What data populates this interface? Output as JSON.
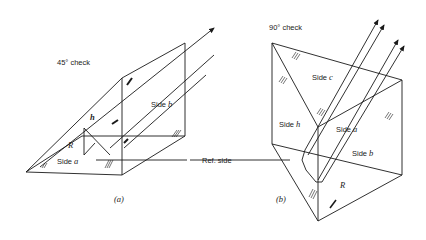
{
  "figure_a": {
    "title": "45° check",
    "side_b": "Side ",
    "side_b_var": "b",
    "side_a": "Side ",
    "side_a_var": "a",
    "h": "h",
    "r": "R",
    "caption": "(a)"
  },
  "figure_b": {
    "title": "90° check",
    "side_c": "Side ",
    "side_c_var": "c",
    "side_h": "Side ",
    "side_h_var": "h",
    "side_a": "Side ",
    "side_a_var": "a",
    "side_b": "Side ",
    "side_b_var": "b",
    "r": "R",
    "caption": "(b)"
  },
  "ref_side": "Ref. side",
  "colors": {
    "line": "#1a1a1a",
    "background": "#ffffff"
  }
}
